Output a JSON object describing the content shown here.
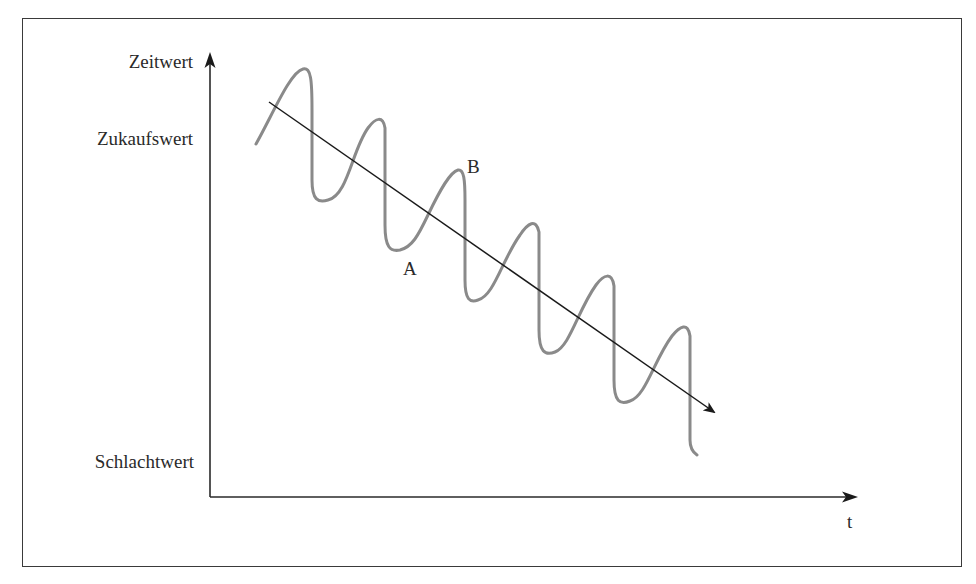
{
  "diagram": {
    "type": "value-over-time",
    "y_axis": {
      "title": "Zeitwert",
      "levels": [
        {
          "label": "Zukaufswert",
          "position": "upper"
        },
        {
          "label": "Schlachtwert",
          "position": "lower"
        }
      ]
    },
    "x_axis": {
      "title": "t"
    },
    "points": [
      {
        "label": "A",
        "description": "trough after a sharp drop"
      },
      {
        "label": "B",
        "description": "peak before a sharp drop"
      }
    ],
    "curves": [
      {
        "name": "oscillating-value",
        "style": "gray sawtooth wave",
        "color": "#8a8a8a"
      },
      {
        "name": "downward-trend",
        "style": "black arrow line",
        "color": "#1a1a1a"
      }
    ]
  },
  "colors": {
    "frame": "#3a3a3a",
    "axis": "#2a2a2a",
    "wave": "#8a8a8a",
    "trend": "#1a1a1a",
    "text": "#2a2a2a"
  }
}
